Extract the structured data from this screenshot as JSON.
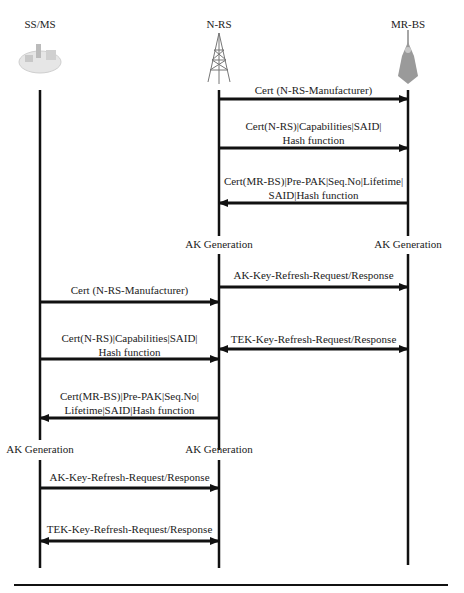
{
  "participants": [
    {
      "id": "ssms",
      "label": "SS/MS",
      "icon": "computer-network-icon"
    },
    {
      "id": "nrs",
      "label": "N-RS",
      "icon": "relay-tower-icon"
    },
    {
      "id": "mrbs",
      "label": "MR-BS",
      "icon": "base-station-tower-icon"
    }
  ],
  "messages": [
    {
      "from": "N-RS",
      "to": "MR-BS",
      "lines": [
        "Cert (N-RS-Manufacturer)"
      ]
    },
    {
      "from": "N-RS",
      "to": "MR-BS",
      "lines": [
        "Cert(N-RS)|Capabilities|SAID|",
        "Hash function"
      ]
    },
    {
      "from": "MR-BS",
      "to": "N-RS",
      "lines": [
        "Cert(MR-BS)|Pre-PAK|Seq.No|Lifetime|",
        "SAID|Hash function"
      ]
    },
    {
      "from": "N-RS",
      "to": "MR-BS",
      "lines": [
        "AK-Key-Refresh-Request/Response"
      ]
    },
    {
      "from": "SS/MS",
      "to": "N-RS",
      "lines": [
        "Cert (N-RS-Manufacturer)"
      ]
    },
    {
      "from": "SS/MS",
      "to": "N-RS",
      "lines": [
        "Cert(N-RS)|Capabilities|SAID|",
        "Hash function"
      ]
    },
    {
      "from": "N-RS",
      "to": "MR-BS",
      "bidirectional": true,
      "lines": [
        "TEK-Key-Refresh-Request/Response"
      ]
    },
    {
      "from": "N-RS",
      "to": "SS/MS",
      "lines": [
        "Cert(MR-BS)|Pre-PAK|Seq.No|",
        "Lifetime|SAID|Hash function"
      ]
    },
    {
      "from": "SS/MS",
      "to": "N-RS",
      "lines": [
        "AK-Key-Refresh-Request/Response"
      ]
    },
    {
      "from": "SS/MS",
      "to": "N-RS",
      "bidirectional": true,
      "lines": [
        "TEK-Key-Refresh-Request/Response"
      ]
    }
  ],
  "events": {
    "ak_gen_nrs_1": "AK Generation",
    "ak_gen_mrbs": "AK Generation",
    "ak_gen_ssms": "AK Generation",
    "ak_gen_nrs_2": "AK Generation"
  }
}
